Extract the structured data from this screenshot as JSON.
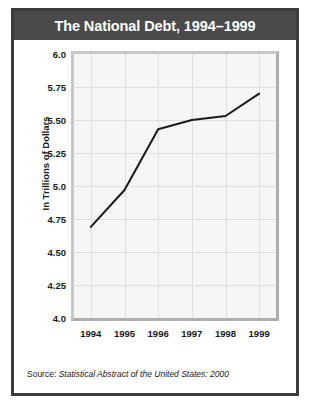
{
  "figure": {
    "title": "The National Debt, 1994–1999",
    "source_label": "Source:",
    "source_reference": "Statistical Abstract of the United States: 2000"
  },
  "colors": {
    "frame": "#3b3b3b",
    "title_bar": "#4a4a4a",
    "title_text": "#ffffff",
    "plot_background": "#f6f6f6",
    "gridline": "#e0e0e0",
    "line": "#1a1a1a",
    "body_background": "#ffffff"
  },
  "chart_data": {
    "type": "line",
    "title": "The National Debt, 1994–1999",
    "subtitle": "",
    "xlabel": "",
    "ylabel": "In Trillions of Dollars",
    "x": [
      1994,
      1995,
      1996,
      1997,
      1998,
      1999
    ],
    "categories": [
      "1994",
      "1995",
      "1996",
      "1997",
      "1998",
      "1999"
    ],
    "values": [
      4.69,
      4.97,
      5.43,
      5.5,
      5.53,
      5.7
    ],
    "series": [
      {
        "name": "National Debt",
        "values": [
          4.69,
          4.97,
          5.43,
          5.5,
          5.53,
          5.7
        ]
      }
    ],
    "xlim": [
      1993.5,
      1999.5
    ],
    "ylim": [
      4.0,
      6.0
    ],
    "ytick_labels": [
      "6.0",
      "5.75",
      "5.50",
      "5.25",
      "5.0",
      "4.75",
      "4.50",
      "4.25",
      "4.0"
    ],
    "ytick_values": [
      6.0,
      5.75,
      5.5,
      5.25,
      5.0,
      4.75,
      4.5,
      4.25,
      4.0
    ],
    "xtick_labels": [
      "1994",
      "1995",
      "1996",
      "1997",
      "1998",
      "1999"
    ],
    "grid": true,
    "legend": false,
    "legend_position": "none",
    "markers": false,
    "annotations": []
  }
}
